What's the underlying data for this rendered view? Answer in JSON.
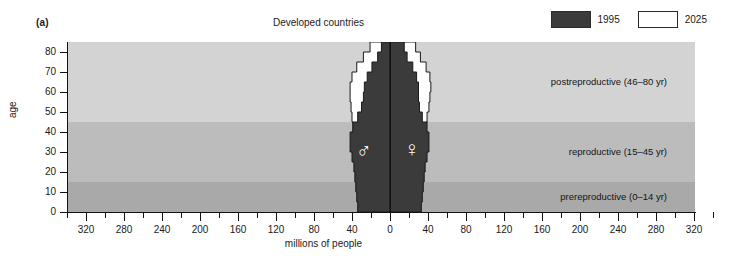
{
  "panel": {
    "label": "(a)"
  },
  "header": {
    "title": "Developed countries"
  },
  "legend": {
    "items": [
      {
        "label": "1995",
        "color": "#3b3b3b",
        "name": "legend-1995"
      },
      {
        "label": "2025",
        "color": "#ffffff",
        "name": "legend-2025"
      }
    ]
  },
  "axes": {
    "y_title": "age",
    "x_title": "millions of people",
    "y_ticks": [
      0,
      10,
      20,
      30,
      40,
      50,
      60,
      70,
      80
    ],
    "x_ticks_left": [
      320,
      280,
      240,
      200,
      160,
      120,
      80,
      40,
      0
    ],
    "x_ticks_right": [
      0,
      40,
      80,
      120,
      160,
      200,
      240,
      280,
      320
    ]
  },
  "bands": [
    {
      "label": "postreproductive (46–80 yr)",
      "from": 45,
      "to": 85,
      "color": "#d3d3d3"
    },
    {
      "label": "reproductive (15–45 yr)",
      "from": 15,
      "to": 45,
      "color": "#bcbcbc"
    },
    {
      "label": "prereproductive (0–14 yr)",
      "from": 0,
      "to": 15,
      "color": "#a9a9a9"
    }
  ],
  "glyphs": {
    "male": "♂",
    "female": "♀"
  },
  "chart_data": {
    "type": "bar",
    "title": "Developed countries",
    "subtitle": "",
    "xlabel": "millions of people",
    "ylabel": "age",
    "xlim": [
      -340,
      340
    ],
    "ylim": [
      0,
      85
    ],
    "grid": false,
    "legend_position": "top-right",
    "orientation": "horizontal-population-pyramid",
    "age_groups": [
      "0-4",
      "5-9",
      "10-14",
      "15-19",
      "20-24",
      "25-29",
      "30-34",
      "35-39",
      "40-44",
      "45-49",
      "50-54",
      "55-59",
      "60-64",
      "65-69",
      "70-74",
      "75-79",
      "80+"
    ],
    "series": [
      {
        "name": "1995",
        "color": "#3b3b3b",
        "male_values": [
          34,
          35,
          36,
          37,
          38,
          40,
          42,
          42,
          39,
          34,
          30,
          28,
          27,
          24,
          19,
          13,
          9
        ],
        "female_values": [
          33,
          34,
          35,
          36,
          37,
          39,
          41,
          41,
          39,
          34,
          31,
          30,
          30,
          28,
          24,
          18,
          15
        ]
      },
      {
        "name": "2025",
        "color": "#ffffff",
        "male_values": [
          31,
          32,
          33,
          34,
          35,
          36,
          37,
          38,
          39,
          40,
          41,
          42,
          42,
          40,
          35,
          28,
          21
        ],
        "female_values": [
          30,
          31,
          32,
          33,
          34,
          35,
          36,
          37,
          38,
          39,
          41,
          42,
          43,
          42,
          38,
          32,
          27
        ]
      }
    ]
  }
}
